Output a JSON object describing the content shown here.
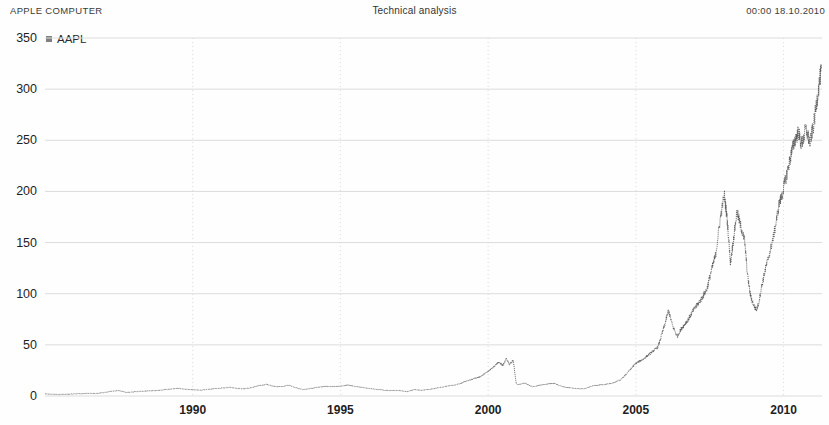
{
  "header": {
    "title_left": "APPLE COMPUTER",
    "title_center": "Technical analysis",
    "timestamp": "00:00 18.10.2010"
  },
  "legend": {
    "series_label": "AAPL",
    "swatch_color": "#808080"
  },
  "chart_data": {
    "type": "line",
    "title": "Technical analysis",
    "subtitle": "APPLE COMPUTER",
    "xlabel": "",
    "ylabel": "",
    "xlim": [
      1985.0,
      2011.3
    ],
    "ylim": [
      0,
      350
    ],
    "grid": true,
    "legend_position": "top-left",
    "line_color": "#4a4a4a",
    "line_style": "dotted",
    "xticks": [
      1990,
      1995,
      2000,
      2005,
      2010
    ],
    "xtick_labels": [
      "1990",
      "1995",
      "2000",
      "2005",
      "2010"
    ],
    "yticks": [
      0,
      50,
      100,
      150,
      200,
      250,
      300,
      350
    ],
    "ytick_labels": [
      "0",
      "50",
      "100",
      "150",
      "200",
      "250",
      "300",
      "350"
    ],
    "series": [
      {
        "name": "AAPL",
        "x": [
          1985.0,
          1985.25,
          1985.5,
          1985.75,
          1986.0,
          1986.25,
          1986.5,
          1986.75,
          1987.0,
          1987.25,
          1987.5,
          1987.75,
          1988.0,
          1988.25,
          1988.5,
          1988.75,
          1989.0,
          1989.25,
          1989.5,
          1989.75,
          1990.0,
          1990.25,
          1990.5,
          1990.75,
          1991.0,
          1991.25,
          1991.5,
          1991.75,
          1992.0,
          1992.25,
          1992.5,
          1992.75,
          1993.0,
          1993.25,
          1993.5,
          1993.75,
          1994.0,
          1994.25,
          1994.5,
          1994.75,
          1995.0,
          1995.25,
          1995.5,
          1995.75,
          1996.0,
          1996.25,
          1996.5,
          1996.75,
          1997.0,
          1997.25,
          1997.5,
          1997.75,
          1998.0,
          1998.25,
          1998.5,
          1998.75,
          1999.0,
          1999.25,
          1999.5,
          1999.75,
          2000.0,
          2000.2,
          2000.35,
          2000.5,
          2000.62,
          2000.72,
          2000.78,
          2000.85,
          2000.95,
          2001.0,
          2001.25,
          2001.5,
          2001.75,
          2002.0,
          2002.25,
          2002.5,
          2002.75,
          2003.0,
          2003.25,
          2003.5,
          2003.75,
          2004.0,
          2004.25,
          2004.5,
          2004.75,
          2005.0,
          2005.25,
          2005.5,
          2005.75,
          2006.0,
          2006.1,
          2006.25,
          2006.4,
          2006.5,
          2006.65,
          2006.8,
          2006.95,
          2007.0,
          2007.2,
          2007.4,
          2007.55,
          2007.7,
          2007.85,
          2007.95,
          2008.0,
          2008.1,
          2008.2,
          2008.3,
          2008.42,
          2008.55,
          2008.68,
          2008.78,
          2008.88,
          2008.95,
          2009.0,
          2009.08,
          2009.15,
          2009.25,
          2009.4,
          2009.55,
          2009.7,
          2009.85,
          2009.95,
          2010.0,
          2010.12,
          2010.25,
          2010.38,
          2010.5,
          2010.6,
          2010.68,
          2010.75,
          2010.82,
          2010.9,
          2010.95,
          2011.0,
          2011.08,
          2011.15,
          2011.22,
          2011.28
        ],
        "y": [
          2.0,
          1.8,
          1.6,
          1.7,
          2.1,
          2.3,
          2.6,
          2.4,
          3.4,
          4.6,
          5.2,
          3.6,
          4.0,
          4.6,
          5.0,
          5.2,
          6.0,
          6.8,
          7.4,
          6.6,
          6.2,
          5.6,
          6.4,
          7.2,
          7.8,
          8.6,
          7.4,
          7.0,
          8.2,
          10.2,
          11.4,
          9.4,
          9.0,
          10.6,
          8.0,
          6.2,
          7.4,
          8.6,
          9.6,
          9.0,
          9.6,
          10.8,
          9.2,
          8.4,
          7.2,
          6.4,
          5.6,
          5.4,
          5.2,
          4.4,
          6.2,
          5.6,
          6.4,
          7.8,
          9.0,
          10.2,
          11.6,
          14.4,
          16.8,
          19.2,
          24.0,
          29.0,
          33.0,
          30.0,
          36.5,
          31.0,
          33.0,
          34.5,
          12.0,
          11.0,
          12.5,
          9.0,
          10.5,
          11.8,
          12.4,
          9.2,
          8.0,
          7.2,
          7.0,
          9.6,
          10.8,
          11.4,
          13.0,
          16.0,
          24.0,
          32.0,
          36.0,
          42.0,
          48.0,
          72.0,
          84.0,
          68.0,
          58.0,
          64.0,
          70.0,
          76.0,
          84.0,
          86.0,
          94.0,
          104.0,
          122.0,
          138.0,
          172.0,
          190.0,
          196.0,
          170.0,
          130.0,
          152.0,
          180.0,
          166.0,
          152.0,
          118.0,
          98.0,
          92.0,
          88.0,
          84.0,
          90.0,
          106.0,
          126.0,
          142.0,
          162.0,
          188.0,
          196.0,
          204.0,
          218.0,
          236.0,
          250.0,
          258.0,
          246.0,
          252.0,
          262.0,
          254.0,
          248.0,
          256.0,
          262.0,
          278.0,
          294.0,
          308.0,
          320.0
        ]
      }
    ]
  },
  "plot_geometry": {
    "left_px": 45,
    "right_px": 822,
    "top_px": 38,
    "bottom_px": 396
  }
}
